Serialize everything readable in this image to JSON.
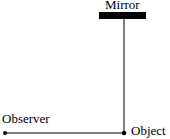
{
  "diagram": {
    "labels": {
      "mirror": "Mirror",
      "observer": "Observer",
      "object": "Object"
    },
    "colors": {
      "ink": "#000000",
      "background": "#ffffff"
    }
  }
}
